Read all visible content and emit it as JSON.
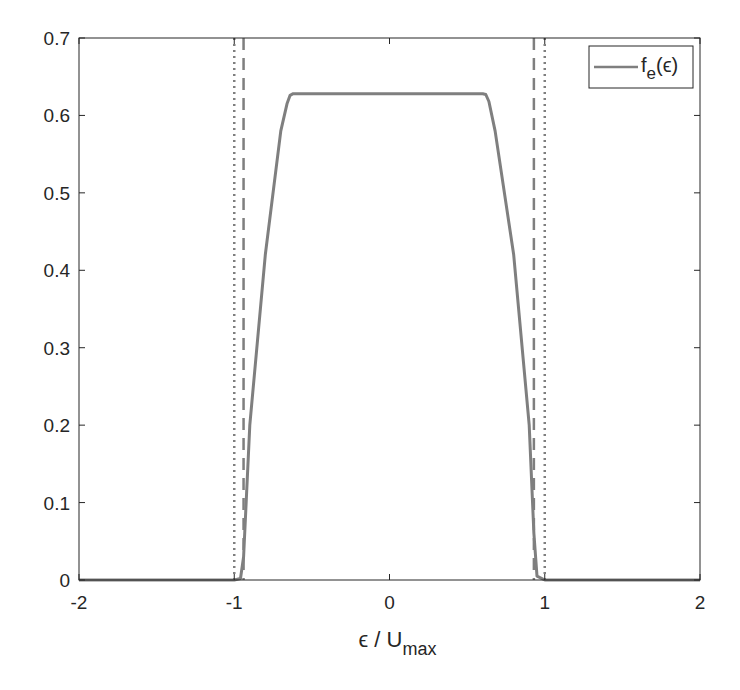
{
  "chart_data": {
    "type": "line",
    "title": "",
    "xlabel": "ϵ / U",
    "xlabel_sub": "max",
    "ylabel": "",
    "xlim": [
      -2,
      2
    ],
    "ylim": [
      0,
      0.7
    ],
    "grid": false,
    "legend_position": "upper right",
    "x_ticks": [
      -2,
      -1,
      0,
      1,
      2
    ],
    "x_tick_labels": [
      "-2",
      "-1",
      "0",
      "1",
      "2"
    ],
    "y_ticks": [
      0,
      0.1,
      0.2,
      0.3,
      0.4,
      0.5,
      0.6,
      0.7
    ],
    "y_tick_labels": [
      "0",
      "0.1",
      "0.2",
      "0.3",
      "0.4",
      "0.5",
      "0.6",
      "0.7"
    ],
    "series": [
      {
        "name": "f_e(ϵ)",
        "legend_main": "f",
        "legend_sub": "e",
        "legend_tail": "(ϵ)",
        "style": "solid",
        "color": "#7f7f7f",
        "x": [
          -2.0,
          -1.0,
          -0.96,
          -0.94,
          -0.9,
          -0.8,
          -0.7,
          -0.66,
          -0.64,
          -0.62,
          0.0,
          0.6,
          0.62,
          0.64,
          0.68,
          0.8,
          0.9,
          0.93,
          0.95,
          1.0,
          2.0
        ],
        "y": [
          0.0,
          0.0,
          0.002,
          0.03,
          0.2,
          0.42,
          0.58,
          0.615,
          0.626,
          0.628,
          0.628,
          0.628,
          0.627,
          0.618,
          0.58,
          0.42,
          0.2,
          0.06,
          0.005,
          0.0,
          0.0
        ]
      }
    ],
    "reference_lines": [
      {
        "name": "dotted-left",
        "x": -1.0,
        "style": "dotted",
        "color": "#7f7f7f"
      },
      {
        "name": "dashed-left",
        "x": -0.94,
        "style": "dashed",
        "color": "#7f7f7f"
      },
      {
        "name": "dashed-right",
        "x": 0.93,
        "style": "dashed",
        "color": "#7f7f7f"
      },
      {
        "name": "dotted-right",
        "x": 1.0,
        "style": "dotted",
        "color": "#7f7f7f"
      }
    ]
  },
  "colors": {
    "axes": "#262626",
    "line": "#7f7f7f",
    "background": "#ffffff"
  }
}
